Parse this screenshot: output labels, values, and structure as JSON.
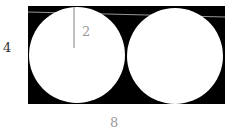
{
  "diagram": {
    "labels": {
      "height": "4",
      "width": "8",
      "radius": "2"
    },
    "colors": {
      "shaded": "#000000",
      "circle_fill": "#ffffff",
      "radius_line": "#aaaaaa",
      "label_gray": "#888888",
      "label_dark": "#333333"
    }
  }
}
